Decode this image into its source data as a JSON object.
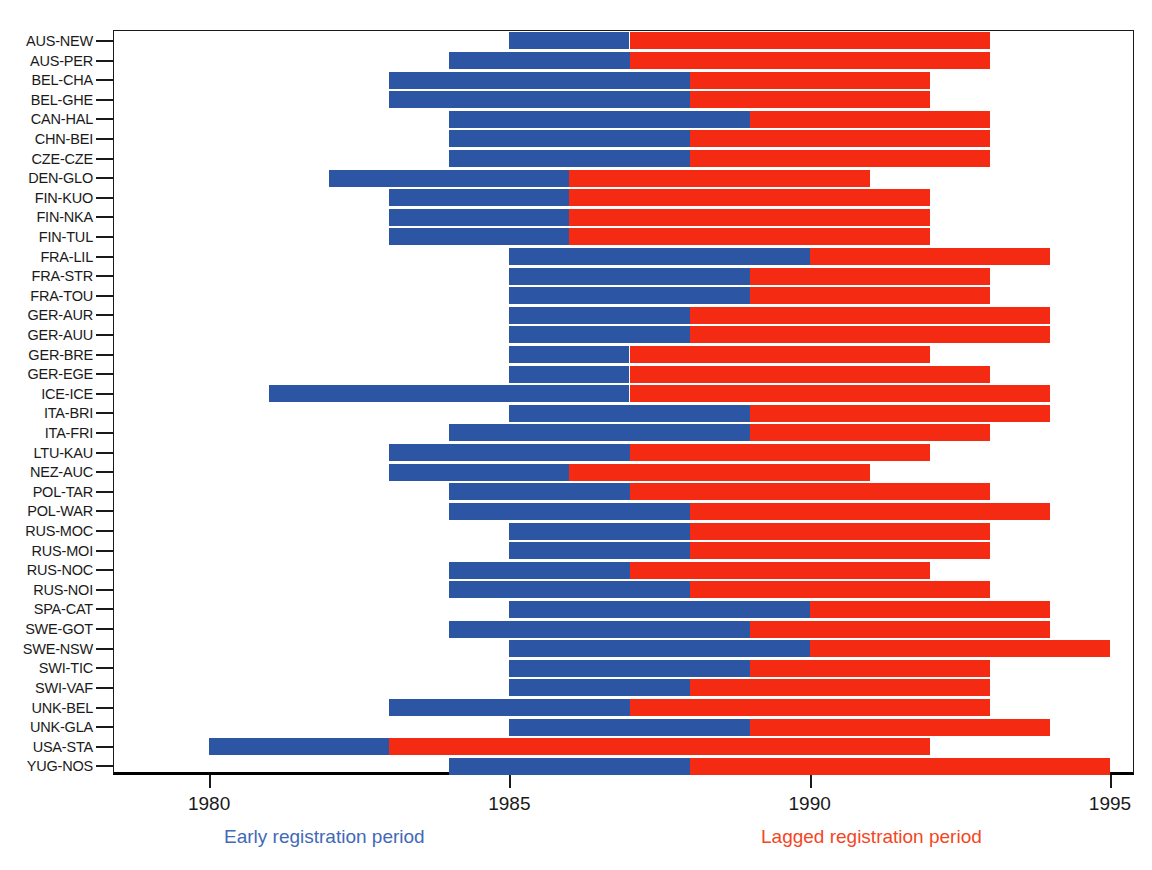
{
  "chart_data": {
    "type": "bar",
    "subtype": "horizontal-stacked-timeline",
    "title": "",
    "xlabel": "",
    "ylabel": "",
    "xlim": [
      1978.4,
      1995.4
    ],
    "ylim": [
      0,
      34
    ],
    "grid": false,
    "legend_position": "below-axis",
    "x_ticks": [
      1980,
      1985,
      1990,
      1995
    ],
    "x_tick_labels": [
      "1980",
      "1985",
      "1990",
      "1995"
    ],
    "categories": [
      "AUS-NEW",
      "AUS-PER",
      "BEL-CHA",
      "BEL-GHE",
      "CAN-HAL",
      "CHN-BEI",
      "CZE-CZE",
      "DEN-GLO",
      "FIN-KUO",
      "FIN-NKA",
      "FIN-TUL",
      "FRA-LIL",
      "FRA-STR",
      "FRA-TOU",
      "GER-AUR",
      "GER-AUU",
      "GER-BRE",
      "GER-EGE",
      "ICE-ICE",
      "ITA-BRI",
      "ITA-FRI",
      "LTU-KAU",
      "NEZ-AUC",
      "POL-TAR",
      "POL-WAR",
      "RUS-MOC",
      "RUS-MOI",
      "RUS-NOC",
      "RUS-NOI",
      "SPA-CAT",
      "SWE-GOT",
      "SWE-NSW",
      "SWI-TIC",
      "SWI-VAF",
      "UNK-BEL",
      "UNK-GLA",
      "USA-STA",
      "YUG-NOS"
    ],
    "series": [
      {
        "name": "Early registration period",
        "color": "#2c55a3"
      },
      {
        "name": "Lagged registration period",
        "color": "#f42a12"
      }
    ],
    "rows": [
      {
        "label": "AUS-NEW",
        "start": 1985,
        "split": 1987,
        "end": 1993
      },
      {
        "label": "AUS-PER",
        "start": 1984,
        "split": 1987,
        "end": 1993
      },
      {
        "label": "BEL-CHA",
        "start": 1983,
        "split": 1988,
        "end": 1992
      },
      {
        "label": "BEL-GHE",
        "start": 1983,
        "split": 1988,
        "end": 1992
      },
      {
        "label": "CAN-HAL",
        "start": 1984,
        "split": 1989,
        "end": 1993
      },
      {
        "label": "CHN-BEI",
        "start": 1984,
        "split": 1988,
        "end": 1993
      },
      {
        "label": "CZE-CZE",
        "start": 1984,
        "split": 1988,
        "end": 1993
      },
      {
        "label": "DEN-GLO",
        "start": 1982,
        "split": 1986,
        "end": 1991
      },
      {
        "label": "FIN-KUO",
        "start": 1983,
        "split": 1986,
        "end": 1992
      },
      {
        "label": "FIN-NKA",
        "start": 1983,
        "split": 1986,
        "end": 1992
      },
      {
        "label": "FIN-TUL",
        "start": 1983,
        "split": 1986,
        "end": 1992
      },
      {
        "label": "FRA-LIL",
        "start": 1985,
        "split": 1990,
        "end": 1994
      },
      {
        "label": "FRA-STR",
        "start": 1985,
        "split": 1989,
        "end": 1993
      },
      {
        "label": "FRA-TOU",
        "start": 1985,
        "split": 1989,
        "end": 1993
      },
      {
        "label": "GER-AUR",
        "start": 1985,
        "split": 1988,
        "end": 1994
      },
      {
        "label": "GER-AUU",
        "start": 1985,
        "split": 1988,
        "end": 1994
      },
      {
        "label": "GER-BRE",
        "start": 1985,
        "split": 1987,
        "end": 1992
      },
      {
        "label": "GER-EGE",
        "start": 1985,
        "split": 1987,
        "end": 1993
      },
      {
        "label": "ICE-ICE",
        "start": 1981,
        "split": 1987,
        "end": 1994
      },
      {
        "label": "ITA-BRI",
        "start": 1985,
        "split": 1989,
        "end": 1994
      },
      {
        "label": "ITA-FRI",
        "start": 1984,
        "split": 1989,
        "end": 1993
      },
      {
        "label": "LTU-KAU",
        "start": 1983,
        "split": 1987,
        "end": 1992
      },
      {
        "label": "NEZ-AUC",
        "start": 1983,
        "split": 1986,
        "end": 1991
      },
      {
        "label": "POL-TAR",
        "start": 1984,
        "split": 1987,
        "end": 1993
      },
      {
        "label": "POL-WAR",
        "start": 1984,
        "split": 1988,
        "end": 1994
      },
      {
        "label": "RUS-MOC",
        "start": 1985,
        "split": 1988,
        "end": 1993
      },
      {
        "label": "RUS-MOI",
        "start": 1985,
        "split": 1988,
        "end": 1993
      },
      {
        "label": "RUS-NOC",
        "start": 1984,
        "split": 1987,
        "end": 1992
      },
      {
        "label": "RUS-NOI",
        "start": 1984,
        "split": 1988,
        "end": 1993
      },
      {
        "label": "SPA-CAT",
        "start": 1985,
        "split": 1990,
        "end": 1994
      },
      {
        "label": "SWE-GOT",
        "start": 1984,
        "split": 1989,
        "end": 1994
      },
      {
        "label": "SWE-NSW",
        "start": 1985,
        "split": 1990,
        "end": 1995
      },
      {
        "label": "SWI-TIC",
        "start": 1985,
        "split": 1989,
        "end": 1993
      },
      {
        "label": "SWI-VAF",
        "start": 1985,
        "split": 1988,
        "end": 1993
      },
      {
        "label": "UNK-BEL",
        "start": 1983,
        "split": 1987,
        "end": 1993
      },
      {
        "label": "UNK-GLA",
        "start": 1985,
        "split": 1989,
        "end": 1994
      },
      {
        "label": "USA-STA",
        "start": 1980,
        "split": 1983,
        "end": 1992
      },
      {
        "label": "YUG-NOS",
        "start": 1984,
        "split": 1988,
        "end": 1995
      }
    ]
  },
  "legend": {
    "early": {
      "text": "Early registration period",
      "color": "#4169b8"
    },
    "lagged": {
      "text": "Lagged registration period",
      "color": "#f4461f"
    }
  },
  "colors": {
    "early_bar": "#2c55a3",
    "lagged_bar": "#f42a12",
    "axis": "#1a1a1a",
    "background": "#ffffff"
  }
}
